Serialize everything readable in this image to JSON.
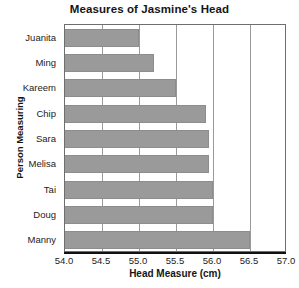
{
  "chart_data": {
    "type": "bar",
    "orientation": "horizontal",
    "title": "Measures of Jasmine's Head",
    "xlabel": "Head Measure (cm)",
    "ylabel": "Person Measuring",
    "categories": [
      "Juanita",
      "Ming",
      "Kareem",
      "Chip",
      "Sara",
      "Melisa",
      "Tai",
      "Doug",
      "Manny"
    ],
    "values": [
      55.0,
      55.2,
      55.5,
      55.9,
      55.95,
      55.95,
      56.0,
      56.0,
      56.5
    ],
    "xlim": [
      54.0,
      57.0
    ],
    "xticks": [
      "54.0",
      "54.5",
      "55.0",
      "55.5",
      "56.0",
      "56.5",
      "57.0"
    ],
    "xtick_values": [
      54.0,
      54.5,
      55.0,
      55.5,
      56.0,
      56.5,
      57.0
    ],
    "grid": "vertical",
    "legend": "none",
    "bar_color": "#9a9a9a",
    "axis_color": "#111111",
    "grid_color": "#9a9a9a",
    "background": "#ffffff"
  }
}
